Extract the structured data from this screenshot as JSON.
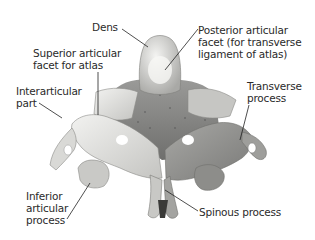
{
  "figure": {
    "colors": {
      "bone_light": "#e8e8e6",
      "bone_mid": "#b9b9b6",
      "bone_dark": "#6e6e6c",
      "leader_line": "#222222",
      "label_text": "#2a2a2a"
    },
    "labels": [
      {
        "id": "dens",
        "text": "Dens"
      },
      {
        "id": "superior_articular_facet",
        "text": "Superior articular\nfacet for atlas"
      },
      {
        "id": "interarticular_part",
        "text": "Interarticular\npart"
      },
      {
        "id": "inferior_articular_process",
        "text": "Inferior\narticular\nprocess"
      },
      {
        "id": "posterior_articular_facet",
        "text": "Posterior articular\nfacet (for transverse\nligament of atlas)"
      },
      {
        "id": "transverse_process",
        "text": "Transverse\nprocess"
      },
      {
        "id": "spinous_process",
        "text": "Spinous process"
      }
    ]
  }
}
